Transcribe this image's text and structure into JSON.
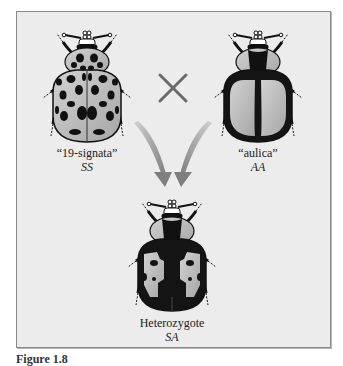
{
  "figure": {
    "cross_symbol": "×",
    "parents": [
      {
        "morph": "“19-signata”",
        "genotype": "SS",
        "pattern": "spotted-pale-elytra"
      },
      {
        "morph": "“aulica”",
        "genotype": "AA",
        "pattern": "dark-with-large-pale-patches"
      }
    ],
    "offspring": {
      "morph": "Heterozygote",
      "genotype": "SA",
      "pattern": "mosaic-dominance"
    },
    "caption_label": "Figure 1.8",
    "caption_text": ""
  },
  "colors": {
    "background": "#ececec",
    "border": "#8a8a8a",
    "pale": "#b9b9b9",
    "dark": "#141414",
    "arrow": "#8c8c8c",
    "cross": "#6a6a6a"
  }
}
